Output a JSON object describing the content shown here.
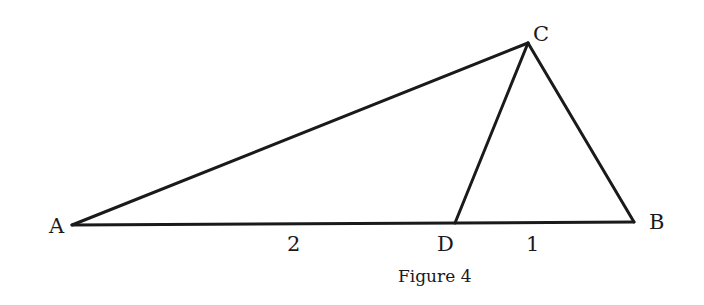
{
  "figure": {
    "caption": "Figure 4",
    "line_color": "#1a1a1a",
    "points": {
      "A": {
        "label": "A",
        "x": 72,
        "y": 225
      },
      "B": {
        "label": "B",
        "x": 634,
        "y": 222
      },
      "C": {
        "label": "C",
        "x": 528,
        "y": 43
      },
      "D": {
        "label": "D",
        "x": 455,
        "y": 223
      }
    },
    "segments": [
      {
        "from": "A",
        "to": "B"
      },
      {
        "from": "A",
        "to": "C"
      },
      {
        "from": "C",
        "to": "B"
      },
      {
        "from": "C",
        "to": "D"
      }
    ],
    "lengths": {
      "AD": "2",
      "DB": "1"
    }
  }
}
